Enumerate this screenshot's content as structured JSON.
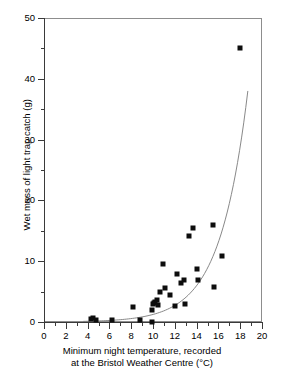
{
  "chart_data": {
    "type": "scatter",
    "title": "",
    "xlabel": "Minimum night temperature, recorded at the Bristol Weather Centre (°C)",
    "xlabel_line1": "Minimum night temperature, recorded",
    "xlabel_line2": "at the Bristol Weather Centre (°C)",
    "ylabel": "Wet mass of light trap catch (g)",
    "xlim": [
      0,
      20
    ],
    "ylim": [
      0,
      50
    ],
    "x_major_ticks": [
      0,
      2,
      4,
      6,
      8,
      10,
      12,
      14,
      16,
      18,
      20
    ],
    "x_minor_ticks": [
      1,
      3,
      5,
      7,
      9,
      11,
      13,
      15,
      17,
      19
    ],
    "x_tick_labels": [
      "0",
      "2",
      "4",
      "6",
      "8",
      "10",
      "12",
      "14",
      "16",
      "18",
      "20"
    ],
    "y_major_ticks": [
      0,
      10,
      20,
      30,
      40,
      50
    ],
    "y_minor_ticks": [
      5,
      15,
      25,
      35,
      45
    ],
    "y_tick_labels": [
      "0",
      "10",
      "20",
      "30",
      "40",
      "50"
    ],
    "grid": false,
    "legend": null,
    "marker_color": "#0d0d0d",
    "marker_shape": "square",
    "curve_color": "#7a7a7a",
    "frame_color": "#8d8d8d",
    "points": [
      {
        "x": 4.3,
        "y": 0.5
      },
      {
        "x": 4.5,
        "y": 0.6
      },
      {
        "x": 4.8,
        "y": 0.4
      },
      {
        "x": 6.25,
        "y": 0.3
      },
      {
        "x": 8.15,
        "y": 2.4
      },
      {
        "x": 8.85,
        "y": 0.4
      },
      {
        "x": 9.9,
        "y": 0.0
      },
      {
        "x": 9.95,
        "y": 2.0
      },
      {
        "x": 10.0,
        "y": 2.9
      },
      {
        "x": 10.05,
        "y": 3.1
      },
      {
        "x": 10.2,
        "y": 3.3
      },
      {
        "x": 10.35,
        "y": 3.6
      },
      {
        "x": 10.45,
        "y": 2.8
      },
      {
        "x": 10.6,
        "y": 5.0
      },
      {
        "x": 10.9,
        "y": 9.6
      },
      {
        "x": 11.1,
        "y": 5.6
      },
      {
        "x": 11.6,
        "y": 4.4
      },
      {
        "x": 12.0,
        "y": 2.6
      },
      {
        "x": 12.2,
        "y": 7.9
      },
      {
        "x": 12.6,
        "y": 6.4
      },
      {
        "x": 12.8,
        "y": 6.9
      },
      {
        "x": 12.9,
        "y": 2.9
      },
      {
        "x": 13.3,
        "y": 14.2
      },
      {
        "x": 13.65,
        "y": 15.5
      },
      {
        "x": 14.0,
        "y": 8.7
      },
      {
        "x": 14.1,
        "y": 6.9
      },
      {
        "x": 15.5,
        "y": 15.9
      },
      {
        "x": 15.6,
        "y": 5.7
      },
      {
        "x": 16.3,
        "y": 10.8
      },
      {
        "x": 18.0,
        "y": 45.0
      }
    ],
    "fit_curve": {
      "description": "exponential trend line fitted through the scatter",
      "x_start": 3.6,
      "x_end": 18.7,
      "y_start": 0.1,
      "y_end": 38.0
    }
  }
}
